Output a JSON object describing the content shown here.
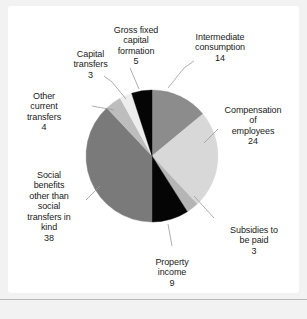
{
  "source": {
    "text": "Source: Eurostat"
  },
  "chart_data": {
    "type": "pie",
    "title": "",
    "legend_position": "callout-labels",
    "total": 100,
    "units": "percent of total general government expenditure",
    "categories": [
      "Intermediate consumption",
      "Compensation of employees",
      "Subsidies to be paid",
      "Property income",
      "Social benefits other than social transfers in kind",
      "Other current transfers",
      "Capital transfers",
      "Gross fixed capital formation"
    ],
    "values": [
      14,
      24,
      3,
      9,
      38,
      4,
      3,
      5
    ],
    "colors": [
      "#8c8c8c",
      "#d8d8d8",
      "#b5b5b5",
      "#050505",
      "#7a7a7a",
      "#bdbdbd",
      "#ededed",
      "#050505"
    ],
    "slices": [
      {
        "label": "Intermediate consumption",
        "value": 14,
        "color": "#8c8c8c"
      },
      {
        "label": "Compensation of employees",
        "value": 24,
        "color": "#d8d8d8"
      },
      {
        "label": "Subsidies to be paid",
        "value": 3,
        "color": "#b5b5b5"
      },
      {
        "label": "Property income",
        "value": 9,
        "color": "#050505"
      },
      {
        "label": "Social benefits other than social transfers in kind",
        "value": 38,
        "color": "#7a7a7a"
      },
      {
        "label": "Other current transfers",
        "value": 4,
        "color": "#bdbdbd"
      },
      {
        "label": "Capital transfers",
        "value": 3,
        "color": "#ededed"
      },
      {
        "label": "Gross fixed capital formation",
        "value": 5,
        "color": "#050505"
      }
    ]
  },
  "labels": {
    "gross_fixed_capital_formation": {
      "name": "Gross fixed\ncapital\nformation",
      "value": "5"
    },
    "intermediate_consumption": {
      "name": "Intermediate\nconsumption",
      "value": "14"
    },
    "capital_transfers": {
      "name": "Capital\ntransfers",
      "value": "3"
    },
    "other_current_transfers": {
      "name": "Other\ncurrent\ntransfers",
      "value": "4"
    },
    "compensation_of_employees": {
      "name": "Compensation\nof\nemployees",
      "value": "24"
    },
    "social_benefits": {
      "name": "Social\nbenefits\nother than\nsocial\ntransfers in\nkind",
      "value": "38"
    },
    "subsidies_to_be_paid": {
      "name": "Subsidies to\nbe paid",
      "value": "3"
    },
    "property_income": {
      "name": "Property\nincome",
      "value": "9"
    }
  }
}
